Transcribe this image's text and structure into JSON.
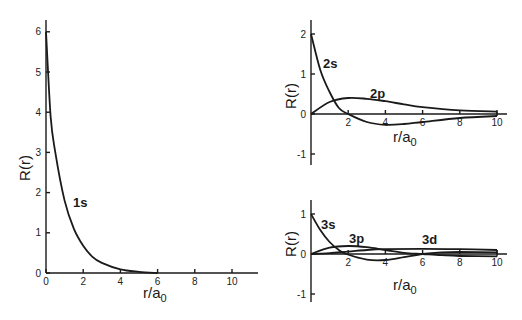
{
  "chart_data": [
    {
      "id": "left",
      "type": "line",
      "title": "",
      "xlabel": "r/a0",
      "ylabel": "R(r)",
      "xlim": [
        0,
        11.5
      ],
      "ylim": [
        0,
        6.3
      ],
      "xticks": [
        0,
        2,
        4,
        6,
        8,
        10
      ],
      "yticks": [
        0,
        1,
        2,
        3,
        4,
        5,
        6
      ],
      "grid": false,
      "series": [
        {
          "name": "1s",
          "label": "1s",
          "x": [
            0,
            0.25,
            0.5,
            1,
            1.5,
            2,
            2.5,
            3,
            4,
            5,
            6
          ],
          "y": [
            6.0,
            3.9,
            3.0,
            1.8,
            1.1,
            0.68,
            0.4,
            0.25,
            0.09,
            0.03,
            0.0
          ]
        }
      ]
    },
    {
      "id": "top-right",
      "type": "line",
      "title": "",
      "xlabel": "r/a0",
      "ylabel": "R(r)",
      "xlim": [
        0,
        11
      ],
      "ylim": [
        -1.3,
        2.3
      ],
      "xticks": [
        2,
        4,
        6,
        8,
        10
      ],
      "yticks": [
        -1,
        0,
        1,
        2
      ],
      "grid": false,
      "series": [
        {
          "name": "2s",
          "label": "2s",
          "x": [
            0,
            0.5,
            1,
            1.5,
            2,
            3,
            4,
            5,
            6,
            8,
            10
          ],
          "y": [
            2.0,
            1.1,
            0.55,
            0.15,
            0.0,
            -0.2,
            -0.27,
            -0.25,
            -0.2,
            -0.1,
            -0.05
          ]
        },
        {
          "name": "2p",
          "label": "2p",
          "x": [
            0,
            1,
            2,
            3,
            4,
            5,
            6,
            8,
            10
          ],
          "y": [
            0.0,
            0.3,
            0.4,
            0.38,
            0.32,
            0.24,
            0.17,
            0.09,
            0.06
          ]
        }
      ]
    },
    {
      "id": "bottom-right",
      "type": "line",
      "title": "",
      "xlabel": "r/a0",
      "ylabel": "R(r)",
      "xlim": [
        0,
        11
      ],
      "ylim": [
        -1.3,
        1.3
      ],
      "xticks": [
        2,
        4,
        6,
        8,
        10
      ],
      "yticks": [
        -1,
        0,
        1
      ],
      "grid": false,
      "series": [
        {
          "name": "3s",
          "label": "3s",
          "x": [
            0,
            0.5,
            1,
            1.5,
            1.9,
            3,
            4,
            5,
            6,
            7,
            8,
            10
          ],
          "y": [
            1.0,
            0.6,
            0.3,
            0.1,
            0.0,
            -0.14,
            -0.15,
            -0.08,
            0.0,
            0.04,
            0.05,
            0.04
          ]
        },
        {
          "name": "3p",
          "label": "3p",
          "x": [
            0,
            1,
            2,
            3,
            4,
            5,
            6,
            7,
            8,
            10
          ],
          "y": [
            0.0,
            0.16,
            0.2,
            0.17,
            0.1,
            0.03,
            0.0,
            -0.03,
            -0.05,
            -0.06
          ]
        },
        {
          "name": "3d",
          "label": "3d",
          "x": [
            0,
            1,
            2,
            3,
            4,
            6,
            8,
            10
          ],
          "y": [
            0.0,
            0.02,
            0.06,
            0.1,
            0.12,
            0.13,
            0.12,
            0.1
          ]
        }
      ]
    }
  ],
  "panels": {
    "left": {
      "ylabel": "R(r)",
      "xlabel_main": "r/a",
      "xlabel_sub": "0",
      "curve_labels": [
        "1s"
      ]
    },
    "top": {
      "ylabel": "R(r)",
      "xlabel_main": "r/a",
      "xlabel_sub": "0",
      "curve_labels": [
        "2s",
        "2p"
      ]
    },
    "bottom": {
      "ylabel": "R(r)",
      "xlabel_main": "r/a",
      "xlabel_sub": "0",
      "curve_labels": [
        "3s",
        "3p",
        "3d"
      ]
    }
  }
}
